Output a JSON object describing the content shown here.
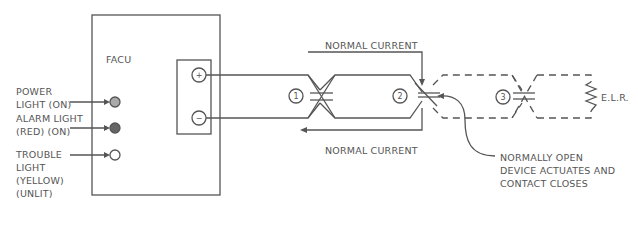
{
  "panel": {
    "title": "FACU",
    "terminals": {
      "positive": "+",
      "negative": "−"
    },
    "lights": [
      {
        "label": "POWER\nLIGHT (ON)",
        "state": "on",
        "color": "#aaaaaa"
      },
      {
        "label": "ALARM LIGHT\n(RED) (ON)",
        "state": "on",
        "color": "#666666"
      },
      {
        "label": "TROUBLE\nLIGHT\n(YELLOW)\n(UNLIT)",
        "state": "unlit",
        "color": "#ffffff"
      }
    ]
  },
  "circuit": {
    "current_top": "NORMAL CURRENT",
    "current_bottom": "NORMAL CURRENT",
    "devices": [
      "1",
      "2",
      "3"
    ],
    "elr": "E.L.R.",
    "callout": "NORMALLY OPEN\nDEVICE ACTUATES AND\nCONTACT CLOSES"
  },
  "colors": {
    "line": "#555555",
    "text": "#555555"
  }
}
